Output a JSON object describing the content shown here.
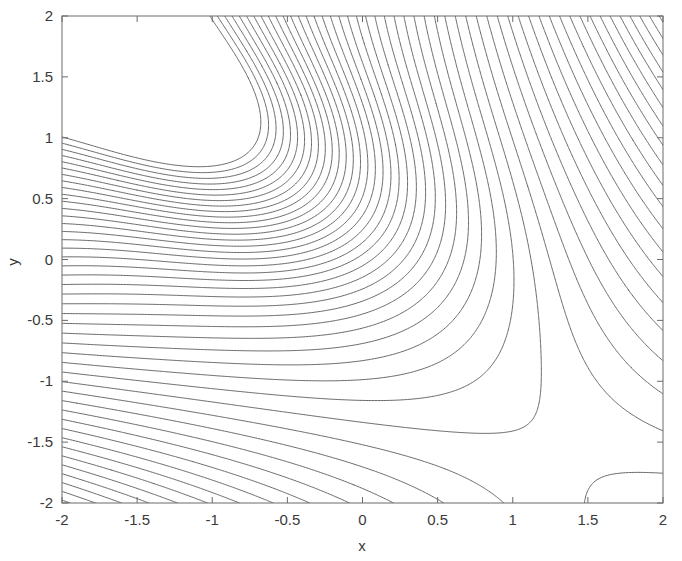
{
  "figure": {
    "background_color": "#ffffff",
    "line_color": "#4d4d4d",
    "frame_color": "#6a6a6a",
    "title": "",
    "plot_box": {
      "left": 62,
      "top": 16,
      "right": 663,
      "bottom": 503
    }
  },
  "chart_data": {
    "type": "contour",
    "title": "",
    "subtitle": "",
    "xlabel": "x",
    "ylabel": "y",
    "xlim": [
      -2,
      2
    ],
    "ylim": [
      -2,
      2
    ],
    "xticks": [
      -2,
      -1.5,
      -1,
      -0.5,
      0,
      0.5,
      1,
      1.5,
      2
    ],
    "xticklabels": [
      "-2",
      "-1.5",
      "-1",
      "-0.5",
      "0",
      "0.5",
      "1",
      "1.5",
      "2"
    ],
    "yticks": [
      -2,
      -1.5,
      -1,
      -0.5,
      0,
      0.5,
      1,
      1.5,
      2
    ],
    "yticklabels": [
      "-2",
      "-1.5",
      "-1",
      "-0.5",
      "0",
      "0.5",
      "1",
      "1.5",
      "2"
    ],
    "grid": false,
    "legend": false,
    "legend_position": "none",
    "filled": false,
    "colormap": "monochrome",
    "n_levels": 60,
    "level_min": -11.0,
    "level_max": 8.4,
    "level_step": 0.33,
    "features": [
      {
        "kind": "local-maximum",
        "x": -1.1,
        "y": 1.2,
        "note": "closed elliptical contours tilted about -40 degrees"
      },
      {
        "kind": "saddle",
        "x": 0.25,
        "y": -0.2,
        "note": "contour lines kink and change direction"
      },
      {
        "kind": "steep-gradient-region",
        "x": 2.0,
        "y": -2.0,
        "note": "very dense parallel diagonal contours in lower-right corner"
      },
      {
        "kind": "steep-gradient-region",
        "x": -2.0,
        "y": -2.0,
        "note": "dense near-vertical contours in lower-left corner"
      }
    ],
    "surface_model": {
      "description": "smooth bivariate surface with one interior maximum and one saddle",
      "peak_amplitude": 6.0,
      "peak_center": [
        -1.1,
        1.2
      ],
      "peak_sigma_major": 1.05,
      "peak_sigma_minor": 0.58,
      "peak_rotation_deg": -40,
      "ramp_coefficients": {
        "x": -1.55,
        "y": 1.05,
        "xy": -1.35,
        "x2": -0.22,
        "y2": -0.22
      }
    }
  },
  "axes": {
    "x_axis_title": "x",
    "y_axis_title": "y"
  }
}
